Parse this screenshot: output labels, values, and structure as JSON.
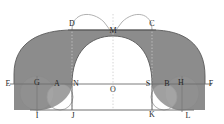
{
  "figure": {
    "canvas": {
      "width": 224,
      "height": 124
    },
    "colors": {
      "shaded_fill": "#8c8c8c",
      "white_fill": "#ffffff",
      "stroke_dark": "#4d4d4d",
      "stroke_mid": "#8c8c8c",
      "stroke_light": "#b3b3b3",
      "dotted": "#c4c4c4",
      "label_text": "#262626",
      "background": "#ffffff"
    },
    "axes": {
      "baseline_y": 84,
      "bottom_y": 110,
      "top_y": 25
    },
    "labels": [
      {
        "name": "D",
        "text": "D",
        "x": 72,
        "y": 24
      },
      {
        "name": "C",
        "text": "C",
        "x": 152,
        "y": 24
      },
      {
        "name": "M",
        "text": "M",
        "x": 113,
        "y": 31
      },
      {
        "name": "E",
        "text": "E",
        "x": 8,
        "y": 84
      },
      {
        "name": "G",
        "text": "G",
        "x": 37,
        "y": 83
      },
      {
        "name": "A",
        "text": "A",
        "x": 57,
        "y": 84
      },
      {
        "name": "N",
        "text": "N",
        "x": 76,
        "y": 84
      },
      {
        "name": "S",
        "text": "S",
        "x": 148,
        "y": 84
      },
      {
        "name": "B",
        "text": "B",
        "x": 167,
        "y": 84
      },
      {
        "name": "H",
        "text": "H",
        "x": 181,
        "y": 83
      },
      {
        "name": "F",
        "text": "F",
        "x": 211,
        "y": 84
      },
      {
        "name": "O",
        "text": "O",
        "x": 113,
        "y": 90
      },
      {
        "name": "I",
        "text": "I",
        "x": 37,
        "y": 116
      },
      {
        "name": "J",
        "text": "J",
        "x": 73,
        "y": 116
      },
      {
        "name": "K",
        "text": "K",
        "x": 152,
        "y": 115
      },
      {
        "name": "L",
        "text": "L",
        "x": 188,
        "y": 116
      }
    ],
    "points": {
      "E": {
        "x": 14,
        "y": 84
      },
      "F": {
        "x": 205,
        "y": 84
      },
      "G": {
        "x": 37,
        "y": 84
      },
      "H": {
        "x": 182,
        "y": 84
      },
      "A": {
        "x": 60,
        "y": 84
      },
      "B": {
        "x": 164,
        "y": 84
      },
      "N": {
        "x": 72,
        "y": 84
      },
      "S": {
        "x": 152,
        "y": 84
      },
      "O": {
        "x": 113,
        "y": 84
      },
      "D": {
        "x": 72,
        "y": 30
      },
      "C": {
        "x": 152,
        "y": 30
      },
      "M": {
        "x": 113,
        "y": 36
      },
      "I": {
        "x": 37,
        "y": 110
      },
      "J": {
        "x": 72,
        "y": 110
      },
      "K": {
        "x": 152,
        "y": 110
      },
      "L": {
        "x": 182,
        "y": 110
      }
    },
    "shapes": {
      "outer_arch_description": "Large shaded arch band spanning E to F with flat top segment D-C",
      "inner_white_arch_description": "White semi-elliptical arch from N to S peaking at M",
      "small_circles": [
        {
          "name": "circle-G",
          "cx": 37,
          "cy": 93,
          "r": 17
        },
        {
          "name": "circle-H",
          "cx": 182,
          "cy": 93,
          "r": 17
        },
        {
          "name": "circle-A",
          "cx": 60,
          "cy": 97,
          "r": 13
        },
        {
          "name": "circle-B",
          "cx": 164,
          "cy": 97,
          "r": 13
        }
      ],
      "top_arcs": [
        {
          "name": "arc-DM",
          "from": "D",
          "to": "M",
          "peak_y": 12
        },
        {
          "name": "arc-MC",
          "from": "M",
          "to": "C",
          "peak_y": 12
        }
      ]
    }
  }
}
